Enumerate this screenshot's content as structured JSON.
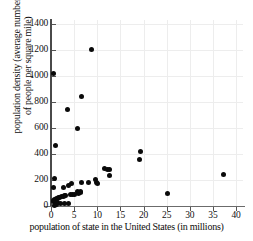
{
  "chart_data": {
    "type": "scatter",
    "title": "",
    "xlabel": "population of state in the United States (in millions)",
    "ylabel_line1": "population density (average number",
    "ylabel_line2": "of people per square mile)",
    "ylabel": "population density (average number of people per square mile)",
    "xlim": [
      0,
      41.5
    ],
    "ylim": [
      0,
      1430
    ],
    "xticks": [
      0,
      5,
      10,
      15,
      20,
      25,
      30,
      35,
      40
    ],
    "xticklabels": [
      "0",
      "5",
      "10",
      "15",
      "20",
      "25",
      "30",
      "35",
      "40"
    ],
    "yticks": [
      0,
      200,
      400,
      600,
      800,
      1000,
      1200,
      1400
    ],
    "yticklabels": [
      "0",
      "200",
      "400",
      "600",
      "800",
      "1000",
      "1200",
      "1400"
    ],
    "grid": true,
    "grid_color": "#ededed",
    "marker_color": "#0a0a0a",
    "marker_shape": "circle",
    "legend": null,
    "points": [
      {
        "x": 0.6,
        "y": 1020
      },
      {
        "x": 8.8,
        "y": 1200
      },
      {
        "x": 6.6,
        "y": 845
      },
      {
        "x": 3.6,
        "y": 740
      },
      {
        "x": 5.8,
        "y": 595
      },
      {
        "x": 0.9,
        "y": 462
      },
      {
        "x": 19.4,
        "y": 417
      },
      {
        "x": 19.1,
        "y": 355
      },
      {
        "x": 11.5,
        "y": 285
      },
      {
        "x": 12.3,
        "y": 283
      },
      {
        "x": 12.7,
        "y": 282
      },
      {
        "x": 12.6,
        "y": 235
      },
      {
        "x": 37.3,
        "y": 245
      },
      {
        "x": 25.1,
        "y": 95
      },
      {
        "x": 0.8,
        "y": 213
      },
      {
        "x": 0.6,
        "y": 142
      },
      {
        "x": 9.7,
        "y": 205
      },
      {
        "x": 9.9,
        "y": 180
      },
      {
        "x": 10.1,
        "y": 175
      },
      {
        "x": 8.0,
        "y": 180
      },
      {
        "x": 6.5,
        "y": 178
      },
      {
        "x": 4.5,
        "y": 170
      },
      {
        "x": 3.8,
        "y": 160
      },
      {
        "x": 2.8,
        "y": 140
      },
      {
        "x": 6.3,
        "y": 110
      },
      {
        "x": 5.7,
        "y": 108
      },
      {
        "x": 6.4,
        "y": 100
      },
      {
        "x": 6.0,
        "y": 96
      },
      {
        "x": 5.0,
        "y": 92
      },
      {
        "x": 4.6,
        "y": 88
      },
      {
        "x": 4.3,
        "y": 85
      },
      {
        "x": 3.1,
        "y": 82
      },
      {
        "x": 2.9,
        "y": 78
      },
      {
        "x": 2.7,
        "y": 74
      },
      {
        "x": 2.3,
        "y": 70
      },
      {
        "x": 1.8,
        "y": 66
      },
      {
        "x": 1.6,
        "y": 62
      },
      {
        "x": 1.3,
        "y": 58
      },
      {
        "x": 1.1,
        "y": 56
      },
      {
        "x": 0.9,
        "y": 52
      },
      {
        "x": 0.7,
        "y": 48
      },
      {
        "x": 0.6,
        "y": 42
      },
      {
        "x": 0.5,
        "y": 36
      },
      {
        "x": 1.0,
        "y": 30
      },
      {
        "x": 1.4,
        "y": 26
      },
      {
        "x": 2.0,
        "y": 22
      },
      {
        "x": 2.9,
        "y": 20
      },
      {
        "x": 3.7,
        "y": 18
      },
      {
        "x": 0.9,
        "y": 14
      },
      {
        "x": 1.2,
        "y": 10
      },
      {
        "x": 0.7,
        "y": 6
      }
    ]
  }
}
